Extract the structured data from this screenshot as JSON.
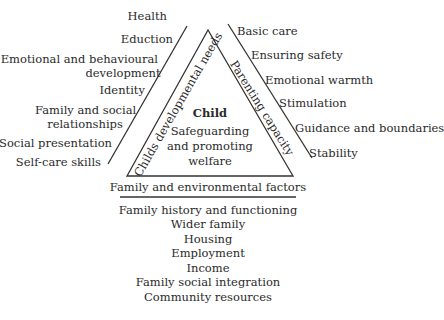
{
  "center": {
    "title": "Child",
    "lines": [
      "Safeguarding",
      "and promoting",
      "welfare"
    ]
  },
  "left_side": {
    "label": "Childs developmental needs",
    "items": [
      "Health",
      "Eduction",
      "Emotional and behavioural",
      "development",
      "Identity",
      "Family and social",
      "relationships",
      "Social presentation",
      "Self-care skills"
    ]
  },
  "right_side": {
    "label": "Parenting capacity",
    "items": [
      "Basic care",
      "Ensuring safety",
      "Emotional warmth",
      "Stimulation",
      "Guidance and boundaries",
      "Stability"
    ]
  },
  "base": {
    "label": "Family and environmental factors",
    "items": [
      "Family history and functioning",
      "Wider family",
      "Housing",
      "Employment",
      "Income",
      "Family social integration",
      "Community resources"
    ]
  }
}
